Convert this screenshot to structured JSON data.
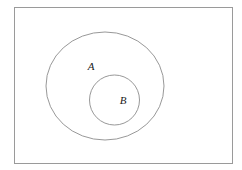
{
  "diagram": {
    "type": "euler-subset-diagram",
    "background_color": "#ffffff",
    "stroke_color": "#8c8c8c",
    "label_color": "#1a1a1a",
    "universe": {
      "shape": "rectangle",
      "x": 14,
      "y": 7,
      "width": 218,
      "height": 156,
      "stroke_color": "#9a9a9a",
      "stroke_width": 1,
      "fill": "none"
    },
    "sets": [
      {
        "id": "set-a",
        "label": "A",
        "shape": "ellipse",
        "cx": 105,
        "cy": 86,
        "rx": 59,
        "ry": 54,
        "stroke_color": "#8c8c8c",
        "stroke_width": 0.9,
        "fill": "none",
        "label_x": 91,
        "label_y": 70
      },
      {
        "id": "set-b",
        "label": "B",
        "shape": "circle",
        "cx": 114.5,
        "cy": 100,
        "r": 25,
        "stroke_color": "#8c8c8c",
        "stroke_width": 0.9,
        "fill": "none",
        "label_x": 123,
        "label_y": 104
      }
    ]
  }
}
